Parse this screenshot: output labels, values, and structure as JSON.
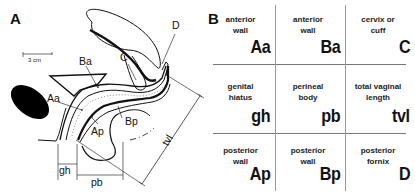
{
  "panel_a": {
    "letter": "A",
    "scale_bar": "3 cm",
    "labels": {
      "Aa": "Aa",
      "Ba": "Ba",
      "C": "C",
      "D": "D",
      "Ap": "Ap",
      "Bp": "Bp",
      "gh": "gh",
      "pb": "pb",
      "tvl": "tvl"
    }
  },
  "panel_b": {
    "letter": "B",
    "cells": [
      {
        "desc_line1": "anterior",
        "desc_line2": "wall",
        "abbr": "Aa"
      },
      {
        "desc_line1": "anterior",
        "desc_line2": "wall",
        "abbr": "Ba"
      },
      {
        "desc_line1": "cervix or",
        "desc_line2": "cuff",
        "abbr": "C"
      },
      {
        "desc_line1": "genital",
        "desc_line2": "hiatus",
        "abbr": "gh"
      },
      {
        "desc_line1": "perineal",
        "desc_line2": "body",
        "abbr": "pb"
      },
      {
        "desc_line1": "total vaginal",
        "desc_line2": "length",
        "abbr": "tvl"
      },
      {
        "desc_line1": "posterior",
        "desc_line2": "wall",
        "abbr": "Ap"
      },
      {
        "desc_line1": "posterior",
        "desc_line2": "wall",
        "abbr": "Bp"
      },
      {
        "desc_line1": "posterior",
        "desc_line2": "fornix",
        "abbr": "D"
      }
    ]
  }
}
